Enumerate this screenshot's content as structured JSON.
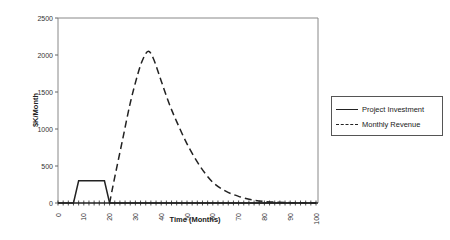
{
  "chart_data": {
    "type": "line",
    "title": "",
    "xlabel": "Time (Months)",
    "ylabel": "$K/Month",
    "xlim": [
      0,
      100
    ],
    "ylim": [
      0,
      2500
    ],
    "x_ticks": [
      0,
      10,
      20,
      30,
      40,
      50,
      60,
      70,
      80,
      90,
      100
    ],
    "y_ticks": [
      0,
      500,
      1000,
      1500,
      2000,
      2500
    ],
    "grid": false,
    "legend_position": "right",
    "series": [
      {
        "name": "Project Investment",
        "style": "solid",
        "x": [
          0,
          6,
          8,
          18,
          20,
          100
        ],
        "y": [
          0,
          0,
          300,
          300,
          0,
          0
        ]
      },
      {
        "name": "Monthly Revenue",
        "style": "dashed",
        "x": [
          20,
          22,
          25,
          28,
          31,
          33,
          35,
          37,
          40,
          43,
          46,
          50,
          55,
          60,
          65,
          70,
          75,
          80,
          85,
          90,
          95,
          100
        ],
        "y": [
          0,
          350,
          850,
          1350,
          1750,
          1950,
          2050,
          1950,
          1650,
          1350,
          1100,
          800,
          500,
          280,
          160,
          90,
          45,
          20,
          10,
          5,
          2,
          0
        ]
      }
    ]
  },
  "legend": {
    "items": [
      {
        "label": "Project Investment"
      },
      {
        "label": "Monthly Revenue"
      }
    ]
  },
  "axes": {
    "xlabel": "Time (Months)",
    "ylabel": "$K/Month"
  }
}
